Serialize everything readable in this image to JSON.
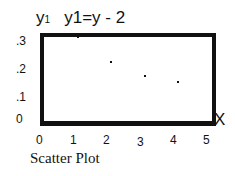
{
  "chart_data": {
    "type": "scatter",
    "title": "y1=y - 2",
    "ylabel": "y1",
    "xlabel": "x",
    "x": [
      1,
      2,
      3,
      4
    ],
    "y": [
      0.3,
      0.21,
      0.16,
      0.14
    ],
    "xlim": [
      0,
      5
    ],
    "ylim": [
      0,
      0.3
    ],
    "xticks": [
      "0",
      "1",
      "2",
      "3",
      "4",
      "5"
    ],
    "yticks": [
      ".3",
      ".2",
      ".1",
      "0"
    ],
    "grid": false,
    "caption": "Scatter Plot"
  },
  "labels": {
    "ylabel_main": "y",
    "ylabel_sub": "1",
    "eq": "y1=y - 2",
    "x": "X",
    "caption": "Scatter Plot"
  }
}
